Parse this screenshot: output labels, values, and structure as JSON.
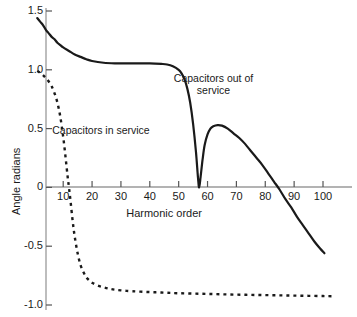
{
  "chart_data": {
    "type": "line",
    "title": "",
    "xlabel": "Harmonic order",
    "ylabel": "Angle radians",
    "xlim": [
      0,
      110
    ],
    "ylim": [
      -1.0,
      1.5
    ],
    "grid": false,
    "legend_position": "inline-annotations",
    "xticks": [
      10,
      20,
      30,
      40,
      50,
      60,
      70,
      80,
      90,
      100
    ],
    "xtick_labels": [
      "10",
      "20",
      "30",
      "40",
      "50",
      "60",
      "70",
      "80",
      "90",
      "100"
    ],
    "yticks": [
      1.5,
      1.0,
      0.5,
      0,
      -0.5,
      -1.0
    ],
    "ytick_labels": [
      "1.5",
      "1.0",
      "0.5",
      "0",
      "-0.5",
      "-1.0"
    ],
    "annotations": [
      {
        "name": "capacitors-in-service-label",
        "text": "Capacitors in service",
        "lines": [
          "Capacitors in service"
        ],
        "x": 23,
        "y": 0.49
      },
      {
        "name": "capacitors-out-of-service-label",
        "text": "Capacitors out of service",
        "lines": [
          "Capacitors out of",
          "service"
        ],
        "x": 62,
        "y": 0.88
      }
    ],
    "series": [
      {
        "name": "Capacitors out of service",
        "style": "solid",
        "color": "#1a1a1a",
        "width": 2.2,
        "points": [
          [
            1,
            1.44
          ],
          [
            2,
            1.41
          ],
          [
            3,
            1.38
          ],
          [
            4,
            1.34
          ],
          [
            5,
            1.31
          ],
          [
            6,
            1.28
          ],
          [
            7,
            1.26
          ],
          [
            8,
            1.23
          ],
          [
            9,
            1.21
          ],
          [
            10,
            1.19
          ],
          [
            12,
            1.16
          ],
          [
            14,
            1.13
          ],
          [
            16,
            1.11
          ],
          [
            18,
            1.09
          ],
          [
            20,
            1.075
          ],
          [
            24,
            1.06
          ],
          [
            28,
            1.055
          ],
          [
            32,
            1.055
          ],
          [
            36,
            1.055
          ],
          [
            40,
            1.055
          ],
          [
            44,
            1.05
          ],
          [
            46,
            1.045
          ],
          [
            48,
            1.03
          ],
          [
            50,
            1.0
          ],
          [
            51,
            0.97
          ],
          [
            52,
            0.92
          ],
          [
            53,
            0.84
          ],
          [
            54,
            0.72
          ],
          [
            55,
            0.54
          ],
          [
            56,
            0.3
          ],
          [
            56.7,
            0.08
          ],
          [
            57.1,
            0.0
          ],
          [
            57.6,
            0.09
          ],
          [
            58.3,
            0.24
          ],
          [
            59,
            0.36
          ],
          [
            60,
            0.45
          ],
          [
            61,
            0.5
          ],
          [
            62,
            0.52
          ],
          [
            63.5,
            0.53
          ],
          [
            65,
            0.525
          ],
          [
            67,
            0.5
          ],
          [
            69,
            0.46
          ],
          [
            71,
            0.42
          ],
          [
            73,
            0.37
          ],
          [
            75,
            0.31
          ],
          [
            77,
            0.25
          ],
          [
            79,
            0.19
          ],
          [
            81,
            0.12
          ],
          [
            83,
            0.05
          ],
          [
            85,
            -0.02
          ],
          [
            87,
            -0.1
          ],
          [
            89,
            -0.17
          ],
          [
            91,
            -0.25
          ],
          [
            93,
            -0.32
          ],
          [
            95,
            -0.39
          ],
          [
            97,
            -0.46
          ],
          [
            99,
            -0.52
          ],
          [
            100.5,
            -0.56
          ]
        ]
      },
      {
        "name": "Capacitors in service",
        "style": "dashed",
        "color": "#1a1a1a",
        "width": 2.4,
        "dash": "3,4",
        "points": [
          [
            1,
            0.99
          ],
          [
            2,
            0.975
          ],
          [
            3,
            0.955
          ],
          [
            4,
            0.93
          ],
          [
            5,
            0.9
          ],
          [
            6,
            0.86
          ],
          [
            7,
            0.8
          ],
          [
            8,
            0.72
          ],
          [
            9,
            0.6
          ],
          [
            10,
            0.43
          ],
          [
            10.8,
            0.26
          ],
          [
            11.5,
            0.1
          ],
          [
            12,
            0.0
          ],
          [
            12.6,
            -0.13
          ],
          [
            13.3,
            -0.29
          ],
          [
            14,
            -0.42
          ],
          [
            15,
            -0.56
          ],
          [
            16,
            -0.66
          ],
          [
            17,
            -0.72
          ],
          [
            18,
            -0.765
          ],
          [
            19,
            -0.79
          ],
          [
            20,
            -0.81
          ],
          [
            22,
            -0.835
          ],
          [
            24,
            -0.85
          ],
          [
            26,
            -0.862
          ],
          [
            28,
            -0.87
          ],
          [
            31,
            -0.878
          ],
          [
            34,
            -0.883
          ],
          [
            38,
            -0.888
          ],
          [
            42,
            -0.892
          ],
          [
            46,
            -0.896
          ],
          [
            50,
            -0.9
          ],
          [
            55,
            -0.903
          ],
          [
            60,
            -0.906
          ],
          [
            65,
            -0.909
          ],
          [
            70,
            -0.912
          ],
          [
            75,
            -0.914
          ],
          [
            80,
            -0.916
          ],
          [
            85,
            -0.918
          ],
          [
            90,
            -0.92
          ],
          [
            95,
            -0.922
          ],
          [
            100,
            -0.924
          ],
          [
            103,
            -0.925
          ]
        ]
      }
    ]
  },
  "axes": {
    "y_axis_name": "y-axis-line",
    "x_axis_name": "x-axis-line"
  }
}
